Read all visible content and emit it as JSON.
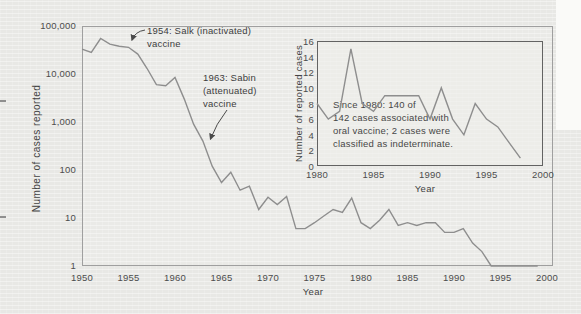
{
  "page": {
    "background_color": "#e8e8e5",
    "curve_color": "#8e8e8e",
    "text_color": "#434343",
    "main_border_color": "#9f9f9f",
    "inset_border_color": "#636363"
  },
  "main_chart": {
    "ylabel": "Number of cases reported",
    "xlabel": "Year",
    "y_ticks": [
      "100,000",
      "10,000",
      "1,000",
      "100",
      "10",
      "1"
    ],
    "x_ticks": [
      "1950",
      "1955",
      "1960",
      "1965",
      "1970",
      "1975",
      "1980",
      "1985",
      "1990",
      "1995",
      "2000"
    ],
    "annotations": {
      "salk": "1954: Salk (inactivated)\nvaccine",
      "sabin": "1963: Sabin\n(attenuated)\nvaccine"
    }
  },
  "inset_chart": {
    "ylabel": "Number of reported cases",
    "xlabel": "Year",
    "y_ticks": [
      "16",
      "14",
      "12",
      "10",
      "8",
      "6",
      "4",
      "2",
      "0"
    ],
    "x_ticks": [
      "1980",
      "1985",
      "1990",
      "1995",
      "2000"
    ],
    "note": "Since 1980: 140 of\n142 cases associated with\noral vaccine; 2 cases were\nclassified as indeterminate."
  },
  "chart_data": [
    {
      "type": "line",
      "title": "Reported polio cases, main chart",
      "xlabel": "Year",
      "ylabel": "Number of cases reported",
      "y_scale": "log",
      "xlim": [
        1950,
        2000
      ],
      "ylim": [
        1,
        100000
      ],
      "grid": false,
      "x": [
        1950,
        1951,
        1952,
        1953,
        1954,
        1955,
        1956,
        1957,
        1958,
        1959,
        1960,
        1961,
        1962,
        1963,
        1964,
        1965,
        1966,
        1967,
        1968,
        1969,
        1970,
        1971,
        1972,
        1973,
        1974,
        1975,
        1976,
        1977,
        1978,
        1979,
        1980,
        1981,
        1982,
        1983,
        1984,
        1985,
        1986,
        1987,
        1988,
        1989,
        1990,
        1991,
        1992,
        1993,
        1994,
        1995,
        1996,
        1997,
        1998,
        1999
      ],
      "y": [
        33000,
        28000,
        55000,
        42000,
        38000,
        36000,
        26000,
        13000,
        6000,
        5700,
        8500,
        3000,
        900,
        400,
        120,
        55,
        90,
        38,
        46,
        15,
        27,
        19,
        28,
        6,
        6,
        8,
        11,
        15,
        13,
        26,
        8,
        6,
        9,
        15,
        7,
        8,
        7,
        8,
        8,
        5,
        5,
        6,
        3,
        2,
        1,
        1,
        1,
        1,
        1,
        1
      ],
      "annotations": [
        {
          "text": "1954: Salk (inactivated) vaccine",
          "arrow_points_to_year": 1955
        },
        {
          "text": "1963: Sabin (attenuated) vaccine",
          "arrow_points_to_year": 1963
        }
      ]
    },
    {
      "type": "line",
      "title": "Reported polio cases since 1980, inset",
      "xlabel": "Year",
      "ylabel": "Number of reported cases",
      "y_scale": "linear",
      "xlim": [
        1980,
        2000
      ],
      "ylim": [
        0,
        16
      ],
      "grid": false,
      "x": [
        1980,
        1981,
        1982,
        1983,
        1984,
        1985,
        1986,
        1987,
        1988,
        1989,
        1990,
        1991,
        1992,
        1993,
        1994,
        1995,
        1996,
        1997,
        1998
      ],
      "y": [
        8,
        6,
        7,
        15,
        8,
        7,
        9,
        9,
        9,
        9,
        6,
        10,
        6,
        4,
        8,
        6,
        5,
        3,
        1
      ],
      "note": "Since 1980: 140 of 142 cases associated with oral vaccine; 2 cases were classified as indeterminate."
    }
  ]
}
